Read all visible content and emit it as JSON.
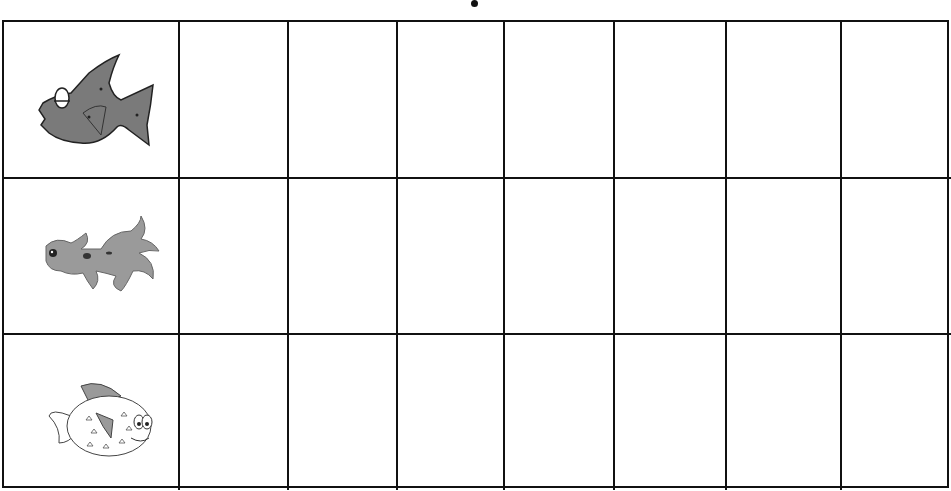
{
  "worksheet": {
    "title_marker": "•",
    "rows": [
      {
        "label": "gray fish with glasses",
        "icon": "grumpy-fish-icon",
        "fill": "#7a7a7a",
        "tally_cells": [
          "",
          "",
          "",
          "",
          "",
          "",
          ""
        ]
      },
      {
        "label": "goldfish",
        "icon": "goldfish-icon",
        "fill": "#9a9a9a",
        "tally_cells": [
          "",
          "",
          "",
          "",
          "",
          "",
          ""
        ]
      },
      {
        "label": "pufferfish",
        "icon": "pufferfish-icon",
        "fill": "#ffffff",
        "tally_cells": [
          "",
          "",
          "",
          "",
          "",
          "",
          ""
        ]
      }
    ],
    "columns_count": 8,
    "line_color": "#111111"
  }
}
